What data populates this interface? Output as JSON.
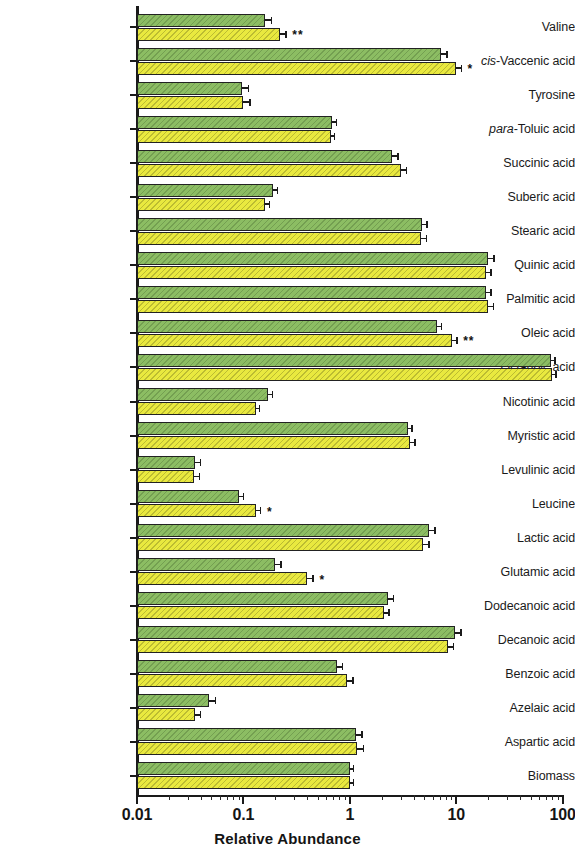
{
  "chart_data": {
    "type": "bar",
    "orientation": "horizontal",
    "title": "",
    "xlabel": "Relative Abundance",
    "ylabel": "",
    "xscale": "log",
    "xlim": [
      0.01,
      100
    ],
    "xticks": [
      "0.01",
      "0.1",
      "1",
      "10",
      "100"
    ],
    "xtick_values": [
      0.01,
      0.1,
      1,
      10,
      100
    ],
    "grid": false,
    "legend": "none",
    "colors": {
      "series_1": "#8cbd63",
      "series_2": "#e9e93f",
      "axis": "#1a1a1a"
    },
    "significance_marker": "*",
    "categories": [
      "Valine",
      "cis-Vaccenic acid",
      "Tyrosine",
      "para-Toluic acid",
      "Succinic acid",
      "Suberic acid",
      "Stearic acid",
      "Quinic acid",
      "Palmitic acid",
      "Oleic acid",
      "Octanoic acid",
      "Nicotinic acid",
      "Myristic acid",
      "Levulinic acid",
      "Leucine",
      "Lactic acid",
      "Glutamic acid",
      "Dodecanoic acid",
      "Decanoic acid",
      "Benzoic acid",
      "Azelaic acid",
      "Aspartic acid",
      "Biomass"
    ],
    "categories_italic_prefix": {
      "cis-Vaccenic acid": "cis",
      "para-Toluic acid": "para"
    },
    "series": [
      {
        "name": "series_1",
        "color": "#8cbd63",
        "values": [
          0.16,
          7.2,
          0.098,
          0.68,
          2.5,
          0.19,
          4.8,
          20.0,
          19.0,
          6.6,
          78.0,
          0.17,
          3.5,
          0.035,
          0.09,
          5.6,
          0.2,
          2.3,
          9.8,
          0.75,
          0.048,
          1.15,
          1.0
        ],
        "errors": [
          0.02,
          0.9,
          0.012,
          0.055,
          0.28,
          0.016,
          0.45,
          2.2,
          2.0,
          0.55,
          4.0,
          0.014,
          0.3,
          0.004,
          0.009,
          0.65,
          0.022,
          0.22,
          1.1,
          0.09,
          0.006,
          0.13,
          0.01
        ]
      },
      {
        "name": "series_2",
        "color": "#e9e93f",
        "values": [
          0.22,
          9.9,
          0.1,
          0.66,
          3.0,
          0.16,
          4.7,
          19.0,
          20.0,
          9.2,
          80.0,
          0.13,
          3.7,
          0.034,
          0.13,
          4.9,
          0.4,
          2.1,
          8.3,
          0.95,
          0.035,
          1.18,
          1.0
        ],
        "errors": [
          0.028,
          1.1,
          0.013,
          0.05,
          0.34,
          0.014,
          0.45,
          2.0,
          2.1,
          0.8,
          4.2,
          0.01,
          0.32,
          0.004,
          0.013,
          0.55,
          0.045,
          0.2,
          0.95,
          0.11,
          0.004,
          0.14,
          0.01
        ]
      }
    ],
    "annotations": [
      {
        "category": "Valine",
        "series": "series_2",
        "marker": "**"
      },
      {
        "category": "cis-Vaccenic acid",
        "series": "series_2",
        "marker": "*"
      },
      {
        "category": "Oleic acid",
        "series": "series_2",
        "marker": "**"
      },
      {
        "category": "Leucine",
        "series": "series_2",
        "marker": "*"
      },
      {
        "category": "Glutamic acid",
        "series": "series_2",
        "marker": "*"
      }
    ]
  }
}
